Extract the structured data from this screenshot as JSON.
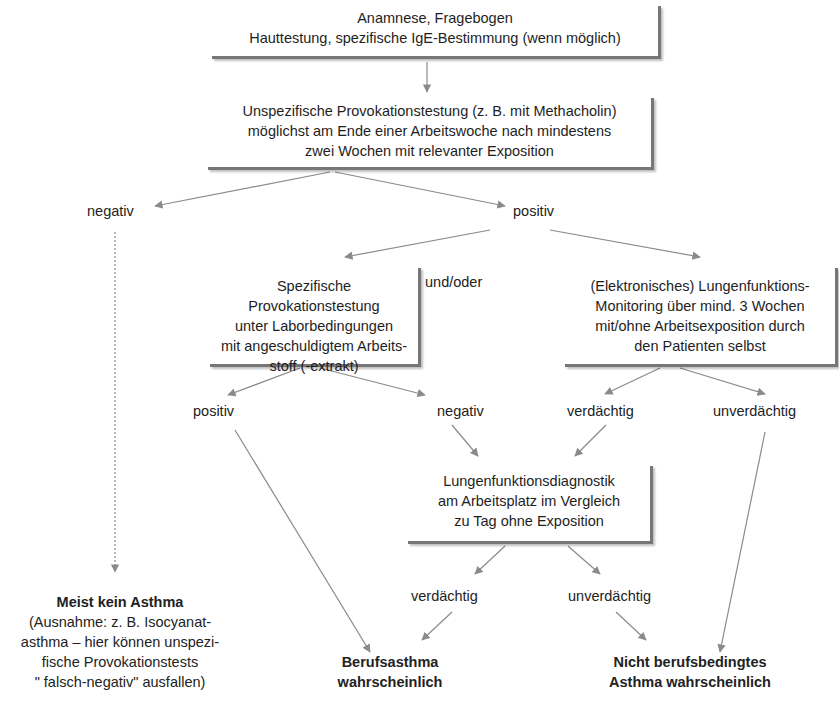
{
  "boxes": {
    "history": {
      "line1": "Anamnese, Fragebogen",
      "line2": "Hauttestung, spezifische IgE-Bestimmung (wenn möglich)"
    },
    "nonspecific_provocation": {
      "line1": "Unspezifische Provokationstestung (z. B. mit Methacholin)",
      "line2": "möglichst am Ende einer Arbeitswoche nach mindestens",
      "line3": "zwei Wochen mit relevanter Exposition"
    },
    "specific_provocation": {
      "line1": "Spezifische Provokationstestung",
      "line2": "unter Laborbedingungen",
      "line3": "mit angeschuldigtem Arbeits-",
      "line4": "stoff (-extrakt)"
    },
    "lung_monitoring": {
      "line1": "(Elektronisches) Lungenfunktions-",
      "line2": "Monitoring über mind. 3 Wochen",
      "line3": "mit/ohne Arbeitsexposition durch",
      "line4": "den Patienten selbst"
    },
    "workplace_diagnostics": {
      "line1": "Lungenfunktionsdiagnostik",
      "line2": "am Arbeitsplatz im Vergleich",
      "line3": "zu Tag ohne Exposition"
    }
  },
  "labels": {
    "negativ_1": "negativ",
    "positiv_1": "positiv",
    "und_oder": "und/oder",
    "positiv_2": "positiv",
    "negativ_2": "negativ",
    "verdaechtig_1": "verdächtig",
    "unverdaechtig_1": "unverdächtig",
    "verdaechtig_2": "verdächtig",
    "unverdaechtig_2": "unverdächtig"
  },
  "outcomes": {
    "no_asthma": {
      "title": "Meist kein Asthma",
      "line1": "(Ausnahme: z. B. Isocyanat-",
      "line2": "asthma – hier können unspezi-",
      "line3": "fische Provokationstests",
      "line4": "\" falsch-negativ\" ausfallen)"
    },
    "occupational_asthma": {
      "line1": "Berufsasthma",
      "line2": "wahrscheinlich"
    },
    "non_occupational_asthma": {
      "line1": "Nicht berufsbedingtes",
      "line2": "Asthma wahrscheinlich"
    }
  },
  "colors": {
    "edge": "#808080",
    "box_shadow": "#777777",
    "text": "#222222"
  }
}
